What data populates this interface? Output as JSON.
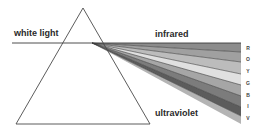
{
  "labels": {
    "white_light": "white light",
    "infrared": "infrared",
    "ultraviolet": "ultraviolet"
  },
  "spectrum_letters": [
    "R",
    "O",
    "Y",
    "G",
    "B",
    "I",
    "V"
  ],
  "bands": [
    {
      "name": "infrared-edge",
      "color": "#8a8a8a"
    },
    {
      "name": "red",
      "color": "#9a9a9a"
    },
    {
      "name": "orange",
      "color": "#b5b5b5"
    },
    {
      "name": "yellow",
      "color": "#dcdcdc"
    },
    {
      "name": "green",
      "color": "#a8a8a8"
    },
    {
      "name": "blue",
      "color": "#7a7a7a"
    },
    {
      "name": "indigo",
      "color": "#5e5e5e"
    },
    {
      "name": "violet",
      "color": "#b0b0b0"
    }
  ]
}
